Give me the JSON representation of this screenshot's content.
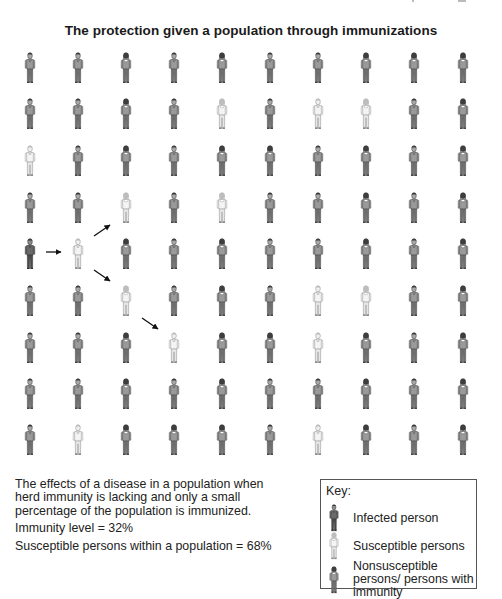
{
  "title": "The protection given a population through immunizations",
  "colors": {
    "infected": "#4a4a4a",
    "susceptible": "#e2e2e2",
    "nonsusceptible": "#7d7d7d",
    "arrow": "#111111",
    "key_border": "#555555"
  },
  "grid": {
    "rows": 9,
    "cols": 10,
    "col_centers": [
      30,
      78,
      126,
      174,
      222,
      270,
      318,
      366,
      414,
      463
    ],
    "row_tops": [
      52,
      98,
      145,
      192,
      238,
      285,
      332,
      378,
      424
    ],
    "legend_codes": {
      "I": "infected",
      "S": "susceptible",
      "N": "nonsusceptible"
    },
    "cells": [
      [
        "N",
        "N",
        "N",
        "N",
        "N",
        "N",
        "N",
        "N",
        "N",
        "N"
      ],
      [
        "N",
        "N",
        "N",
        "N",
        "S",
        "N",
        "S",
        "S",
        "N",
        "N"
      ],
      [
        "S",
        "N",
        "N",
        "N",
        "N",
        "N",
        "N",
        "N",
        "N",
        "N"
      ],
      [
        "N",
        "N",
        "S",
        "N",
        "S",
        "N",
        "N",
        "N",
        "N",
        "N"
      ],
      [
        "I",
        "S",
        "N",
        "N",
        "N",
        "N",
        "N",
        "N",
        "N",
        "N"
      ],
      [
        "N",
        "N",
        "S",
        "N",
        "N",
        "N",
        "S",
        "S",
        "N",
        "N"
      ],
      [
        "N",
        "N",
        "N",
        "S",
        "N",
        "N",
        "S",
        "N",
        "N",
        "N"
      ],
      [
        "N",
        "N",
        "N",
        "N",
        "N",
        "N",
        "N",
        "N",
        "N",
        "N"
      ],
      [
        "N",
        "S",
        "N",
        "N",
        "N",
        "N",
        "S",
        "N",
        "N",
        "N"
      ]
    ],
    "genders": [
      [
        "m",
        "m",
        "f",
        "m",
        "f",
        "m",
        "m",
        "f",
        "f",
        "f"
      ],
      [
        "m",
        "m",
        "f",
        "m",
        "f",
        "m",
        "m",
        "f",
        "m",
        "f"
      ],
      [
        "m",
        "m",
        "f",
        "m",
        "f",
        "f",
        "m",
        "f",
        "m",
        "f"
      ],
      [
        "m",
        "m",
        "f",
        "m",
        "f",
        "m",
        "m",
        "f",
        "m",
        "f"
      ],
      [
        "m",
        "m",
        "f",
        "m",
        "f",
        "m",
        "m",
        "f",
        "m",
        "f"
      ],
      [
        "m",
        "m",
        "f",
        "m",
        "f",
        "m",
        "m",
        "f",
        "m",
        "f"
      ],
      [
        "m",
        "m",
        "f",
        "m",
        "f",
        "f",
        "m",
        "f",
        "m",
        "f"
      ],
      [
        "m",
        "m",
        "f",
        "m",
        "f",
        "m",
        "m",
        "f",
        "m",
        "f"
      ],
      [
        "m",
        "m",
        "f",
        "f",
        "f",
        "m",
        "m",
        "f",
        "m",
        "f"
      ]
    ],
    "counts": {
      "total": 90,
      "susceptible": 14,
      "infected": 1,
      "nonsusceptible": 75
    }
  },
  "arrows": [
    {
      "from": "row5-col1",
      "to": "row5-col2",
      "x1": 46,
      "y1": 252,
      "x2": 61,
      "y2": 252
    },
    {
      "from": "row5-col2",
      "to": "row4-col3",
      "x1": 94,
      "y1": 236,
      "x2": 110,
      "y2": 225
    },
    {
      "from": "row5-col2",
      "to": "row6-col3",
      "x1": 94,
      "y1": 270,
      "x2": 110,
      "y2": 281
    },
    {
      "from": "row6-col3",
      "to": "row7-col4",
      "x1": 142,
      "y1": 318,
      "x2": 158,
      "y2": 329
    }
  ],
  "caption": {
    "description": "The effects of a disease in a population when herd immunity is lacking and only a small percentage of the population is immunized.",
    "immunity_level": "Immunity level = 32%",
    "susceptible_share": "Susceptible persons within a population = 68%"
  },
  "key": {
    "title": "Key:",
    "items": [
      {
        "type": "infected",
        "label": "Infected person"
      },
      {
        "type": "susceptible",
        "label": "Susceptible persons"
      },
      {
        "type": "nonsusceptible",
        "label": "Nonsusceptible persons/ persons with immunity"
      }
    ]
  }
}
